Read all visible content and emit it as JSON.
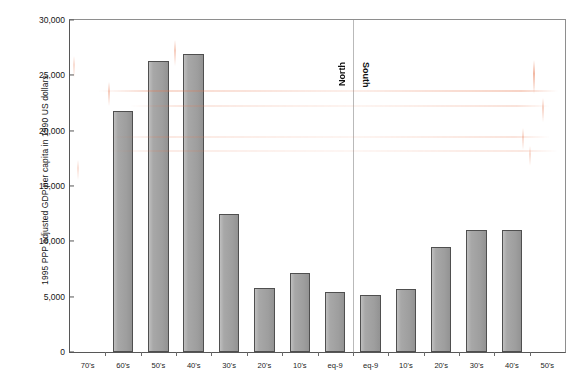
{
  "chart_data": {
    "type": "bar",
    "title": "",
    "subtitle": "",
    "xlabel": "",
    "ylabel": "1995 PPP adjusted GDP per capita in 1990 US dollars",
    "ylim": [
      0,
      30000
    ],
    "yticks": [
      0,
      5000,
      10000,
      15000,
      20000,
      25000,
      30000
    ],
    "ytick_labels": [
      "0",
      "5,000",
      "10,000",
      "15,000",
      "20,000",
      "25,000",
      "30,000"
    ],
    "grid": false,
    "legend": "none",
    "categories": [
      "70's",
      "60's",
      "50's",
      "40's",
      "30's",
      "20's",
      "10's",
      "eq-9",
      "eq-9",
      "10's",
      "20's",
      "30's",
      "40's",
      "50's"
    ],
    "values": [
      null,
      21800,
      26300,
      26900,
      12500,
      5800,
      7100,
      5450,
      5150,
      5650,
      9450,
      11000,
      11000,
      null
    ],
    "annotations": [
      {
        "text": "North",
        "region": "left-of-divider",
        "orientation": "vertical-up"
      },
      {
        "text": "South",
        "region": "right-of-divider",
        "orientation": "vertical-down"
      }
    ],
    "divider": {
      "between": [
        "eq-9",
        "eq-9"
      ],
      "style": "thin-vertical-line"
    },
    "colors": {
      "bar_fill": "#a3a3a3",
      "bar_edge": "#4f4f4f",
      "axis": "#575757",
      "frame": "#8e8e8e",
      "text": "#171717",
      "divider": "#b9b9b9",
      "smudge": "#e77850"
    }
  },
  "axis": {
    "y_title": "1995 PPP adjusted GDP per capita in 1990 US dollars",
    "y_labels": [
      "30,000",
      "25,000",
      "20,000",
      "15,000",
      "10,000",
      "5,000",
      "0"
    ],
    "x_labels": [
      "70's",
      "60's",
      "50's",
      "40's",
      "30's",
      "20's",
      "10's",
      "eq-9",
      "eq-9",
      "10's",
      "20's",
      "30's",
      "40's",
      "50's"
    ]
  },
  "regions": {
    "left_label": "North",
    "right_label": "South"
  }
}
